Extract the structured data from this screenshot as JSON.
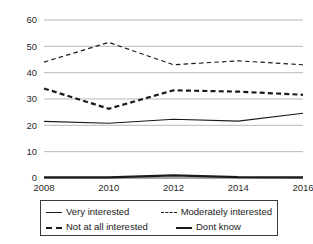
{
  "chart_data": {
    "type": "line",
    "title": "",
    "subtitle": "",
    "xlabel": "",
    "ylabel": "",
    "x": [
      2008,
      2010,
      2012,
      2014,
      2016
    ],
    "categories": [
      "2008",
      "2010",
      "2012",
      "2014",
      "2016"
    ],
    "xtick_labels": [
      "2008",
      "2010",
      "2012",
      "2014",
      "2016"
    ],
    "ytick_labels": [
      "0",
      "10",
      "20",
      "30",
      "40",
      "50",
      "60"
    ],
    "ytick_values": [
      0,
      10,
      20,
      30,
      40,
      50,
      60
    ],
    "ylim": [
      0,
      60
    ],
    "xlim": [
      2008,
      2016
    ],
    "grid": "horizontal",
    "legend_position": "below-plot",
    "series": [
      {
        "name": "Very interested",
        "values": [
          21.5,
          20.8,
          22.3,
          21.6,
          24.6
        ],
        "style": "solid",
        "weight": "thin",
        "color": "#1a1a1a"
      },
      {
        "name": "Moderately interested",
        "values": [
          44.0,
          51.5,
          43.0,
          44.5,
          43.0
        ],
        "style": "dashed",
        "weight": "thin",
        "color": "#1a1a1a"
      },
      {
        "name": "Not at all interested",
        "values": [
          34.0,
          26.3,
          33.3,
          32.8,
          31.6
        ],
        "style": "dashed",
        "weight": "bold",
        "color": "#1a1a1a"
      },
      {
        "name": "Dont know",
        "values": [
          0.2,
          0.2,
          1.0,
          0.3,
          0.2
        ],
        "style": "solid",
        "weight": "bold",
        "color": "#1a1a1a"
      }
    ]
  },
  "legend": {
    "entries": [
      {
        "label": "Very interested"
      },
      {
        "label": "Moderately interested"
      },
      {
        "label": "Not at all interested"
      },
      {
        "label": "Dont know"
      }
    ]
  }
}
